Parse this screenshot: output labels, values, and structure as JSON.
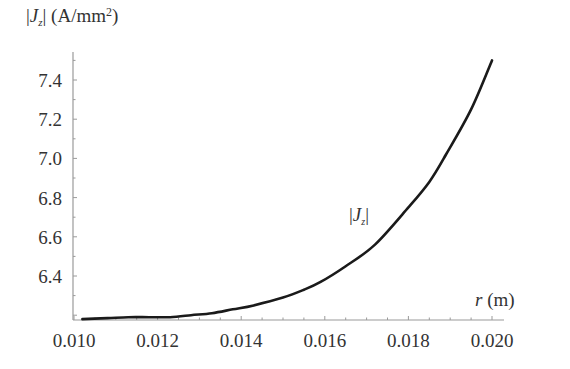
{
  "chart_data": {
    "type": "line",
    "title": "",
    "xlabel": "r (m)",
    "ylabel": "|J_z| (A/mm²)",
    "xlim": [
      0.01,
      0.02
    ],
    "ylim": [
      6.18,
      7.5
    ],
    "xticks": [
      "0.010",
      "0.012",
      "0.014",
      "0.016",
      "0.018",
      "0.020"
    ],
    "yticks": [
      "6.4",
      "6.6",
      "6.8",
      "7.0",
      "7.2",
      "7.4"
    ],
    "grid": false,
    "legend": null,
    "annotations": [
      {
        "text": "|J_z|",
        "x": 0.0172,
        "y": 6.78
      }
    ],
    "series": [
      {
        "name": "|J_z|",
        "x": [
          0.0102,
          0.0108,
          0.0113,
          0.0118,
          0.0123,
          0.0128,
          0.0133,
          0.0138,
          0.0143,
          0.015,
          0.0155,
          0.0159,
          0.0165,
          0.0172,
          0.018,
          0.0185,
          0.0189,
          0.0195,
          0.02
        ],
        "y": [
          6.18,
          6.185,
          6.19,
          6.19,
          6.19,
          6.2,
          6.21,
          6.23,
          6.25,
          6.29,
          6.33,
          6.37,
          6.45,
          6.56,
          6.75,
          6.88,
          7.02,
          7.25,
          7.5
        ]
      }
    ]
  },
  "labels": {
    "y_axis_prefix": "|",
    "y_axis_var": "J",
    "y_axis_sub": "z",
    "y_axis_units": "| (A/mm",
    "y_axis_sup": "2",
    "y_axis_close": ")",
    "x_axis_var": "r",
    "x_axis_units": " (m)",
    "curve_var": "J",
    "curve_sub": "z"
  },
  "style": {
    "line_color": "#1a1a1a",
    "axis_color": "#9a9a9a"
  }
}
